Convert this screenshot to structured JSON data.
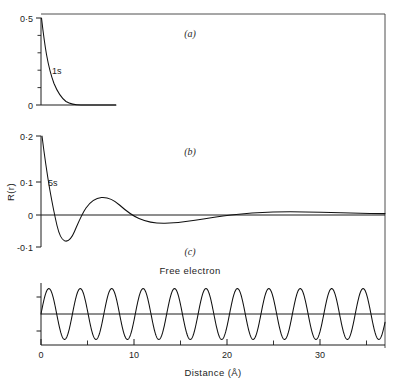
{
  "figure": {
    "background": "#ffffff",
    "ink_color": "#101010"
  },
  "chart_data": {
    "type": "line",
    "title": "",
    "xlabel": "Distance  (Å)",
    "ylabel": "R(r)",
    "grid": false,
    "legend": "none",
    "xlim": [
      0,
      37
    ],
    "xticks": [
      0,
      10,
      20,
      30
    ],
    "xticklabels": [
      "0",
      "10",
      "20",
      "30"
    ],
    "xminorticks": [
      5,
      15,
      25,
      35
    ],
    "panels": [
      {
        "id": "a",
        "label": "(a)",
        "curve_label": "1s",
        "ylim": [
          0,
          0.5
        ],
        "yticks": [
          0,
          0.5
        ],
        "yticklabels": [
          "0",
          "0·5"
        ],
        "yminorticks": [
          0.1,
          0.2,
          0.3,
          0.4
        ],
        "description": "1s radial wave function: exponential decay",
        "x": [
          0.0,
          0.15,
          0.3,
          0.45,
          0.6,
          0.8,
          1.0,
          1.2,
          1.5,
          1.8,
          2.1,
          2.5,
          2.9,
          3.3,
          3.8,
          4.3,
          5.0,
          5.6,
          6.2,
          7.0,
          8.0,
          9.0,
          37.0
        ],
        "y": [
          0.5,
          0.44,
          0.385,
          0.338,
          0.295,
          0.248,
          0.208,
          0.175,
          0.133,
          0.101,
          0.077,
          0.052,
          0.036,
          0.024,
          0.014,
          0.0085,
          0.004,
          0.002,
          0.001,
          0.0004,
          0.0001,
          0.0,
          0.0
        ]
      },
      {
        "id": "b",
        "label": "(b)",
        "curve_label": "5s",
        "ylim": [
          -0.1,
          0.2
        ],
        "yticks": [
          -0.1,
          0,
          0.1,
          0.2
        ],
        "yticklabels": [
          "-0·1",
          "0",
          "0·1",
          "0·2"
        ],
        "description": "5s radial wave function: damped oscillation with four nodes",
        "x": [
          0.0,
          0.25,
          0.5,
          0.75,
          1.0,
          1.3,
          1.6,
          1.9,
          2.2,
          2.6,
          3.0,
          3.4,
          3.8,
          4.3,
          4.8,
          5.4,
          6.0,
          6.8,
          7.6,
          8.5,
          9.4,
          10.4,
          11.5,
          12.6,
          13.8,
          15.0,
          16.3,
          17.6,
          19.0,
          20.4,
          21.8,
          23.3,
          24.8,
          26.3,
          27.8,
          29.3,
          30.8,
          32.3,
          33.8,
          35.2,
          36.5,
          37.0
        ],
        "y": [
          0.2,
          0.163,
          0.118,
          0.07,
          0.028,
          -0.02,
          -0.049,
          -0.063,
          -0.067,
          -0.062,
          -0.05,
          -0.035,
          -0.02,
          -0.004,
          0.008,
          0.017,
          0.021,
          0.023,
          0.021,
          0.016,
          0.01,
          0.004,
          -0.0015,
          -0.0055,
          -0.0085,
          -0.0105,
          -0.0115,
          -0.0115,
          -0.011,
          -0.0095,
          -0.0078,
          -0.0058,
          -0.0038,
          -0.002,
          -0.0006,
          0.0005,
          0.0013,
          0.0018,
          0.002,
          0.002,
          0.0018,
          0.0017
        ]
      },
      {
        "id": "c",
        "label": "(c)",
        "curve_label": "Free electron",
        "ylim": [
          -1,
          1
        ],
        "yticks": [
          -0.55,
          0,
          0.55
        ],
        "yticklabels": [
          "",
          "",
          ""
        ],
        "description": "Free electron: undamped sinusoidal wave",
        "waveform": "sine",
        "amplitude": 0.82,
        "wavelength": 3.38,
        "phase_deg": 0,
        "cycles": 11
      }
    ]
  }
}
